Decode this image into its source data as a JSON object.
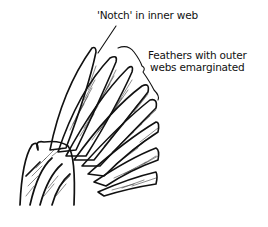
{
  "diagram": {
    "labels": {
      "notch": "'Notch' in inner web",
      "emarginated_line1": "Feathers with outer",
      "emarginated_line2": "webs emarginated"
    },
    "colors": {
      "ink": "#111111",
      "background": "#ffffff"
    }
  }
}
